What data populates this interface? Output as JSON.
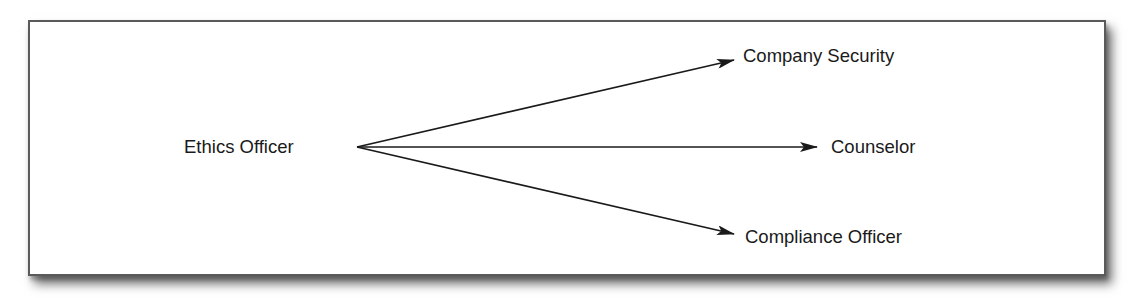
{
  "diagram": {
    "type": "flow",
    "source": {
      "id": "ethics-officer",
      "label": "Ethics Officer",
      "x": 184,
      "y": 147
    },
    "targets": [
      {
        "id": "company-security",
        "label": "Company Security",
        "x": 743,
        "y": 56
      },
      {
        "id": "counselor",
        "label": "Counselor",
        "x": 831,
        "y": 147
      },
      {
        "id": "compliance-officer",
        "label": "Compliance Officer",
        "x": 745,
        "y": 237
      }
    ],
    "edges": [
      {
        "from": "ethics-officer",
        "to": "company-security",
        "x1": 357,
        "y1": 147,
        "x2": 734,
        "y2": 60
      },
      {
        "from": "ethics-officer",
        "to": "counselor",
        "x1": 357,
        "y1": 147,
        "x2": 817,
        "y2": 147
      },
      {
        "from": "ethics-officer",
        "to": "compliance-officer",
        "x1": 357,
        "y1": 147,
        "x2": 734,
        "y2": 234
      }
    ],
    "colors": {
      "line": "#1a1a1a",
      "text": "#1a1a1a",
      "border": "#5a5a5a",
      "background": "#ffffff"
    }
  }
}
